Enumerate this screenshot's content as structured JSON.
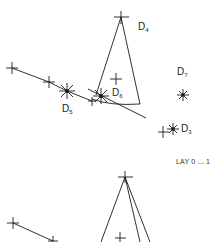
{
  "diagram": {
    "labels": {
      "d4": {
        "base": "D",
        "sub": "4"
      },
      "d5": {
        "base": "D",
        "sub": "5"
      },
      "d6": {
        "base": "D",
        "sub": "6"
      },
      "d7": {
        "base": "D",
        "sub": "7"
      },
      "d3": {
        "base": "D",
        "sub": "3"
      }
    },
    "layer_caption": "LAY 0 ⌴ 1",
    "colors": {
      "stroke": "#1a1a1a",
      "background": "#ffffff"
    }
  }
}
